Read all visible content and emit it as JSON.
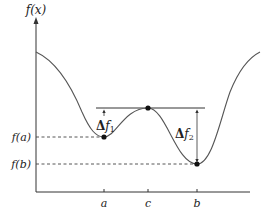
{
  "figure": {
    "y_axis_label": "f(x)",
    "y_labels": {
      "fa": "f(a)",
      "fb": "f(b)"
    },
    "x_ticks": [
      {
        "label": "a",
        "x": 104
      },
      {
        "label": "c",
        "x": 148
      },
      {
        "label": "b",
        "x": 197
      }
    ],
    "annotations": {
      "delta1_sym": "Δ",
      "delta1_fn": "f",
      "delta1_sub": "1",
      "delta2_sym": "Δ",
      "delta2_fn": "f",
      "delta2_sub": "2"
    },
    "colors": {
      "line": "#333333",
      "curve": "#555555"
    }
  }
}
